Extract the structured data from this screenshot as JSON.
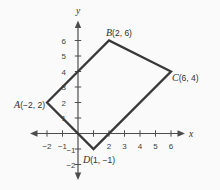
{
  "figure": {
    "type": "coordinate-plane-quadrilateral",
    "x_axis_label": "x",
    "y_axis_label": "y",
    "x_ticks": [
      {
        "value": -2,
        "label": "−2"
      },
      {
        "value": -1,
        "label": "−1"
      },
      {
        "value": 1,
        "label": ""
      },
      {
        "value": 2,
        "label": "2"
      },
      {
        "value": 3,
        "label": "3"
      },
      {
        "value": 4,
        "label": "4"
      },
      {
        "value": 5,
        "label": "5"
      },
      {
        "value": 6,
        "label": "6"
      }
    ],
    "y_ticks": [
      {
        "value": 6,
        "label": "6"
      },
      {
        "value": 5,
        "label": "5"
      },
      {
        "value": 4,
        "label": "4"
      },
      {
        "value": 3,
        "label": "3"
      },
      {
        "value": 2,
        "label": "2"
      },
      {
        "value": 1,
        "label": "1"
      },
      {
        "value": -1,
        "label": "−1"
      },
      {
        "value": -2,
        "label": "−2"
      }
    ],
    "vertices": [
      {
        "name": "A",
        "x": -2,
        "y": 2,
        "letter": "A",
        "coords": "(−2, 2)"
      },
      {
        "name": "B",
        "x": 2,
        "y": 6,
        "letter": "B",
        "coords": "(2, 6)"
      },
      {
        "name": "C",
        "x": 6,
        "y": 4,
        "letter": "C",
        "coords": "(6, 4)"
      },
      {
        "name": "D",
        "x": 1,
        "y": -1,
        "letter": "D",
        "coords": "(1, −1)"
      }
    ],
    "colors": {
      "axis": "#4d4d4d",
      "polygon": "#383838",
      "text": "#2f2f2f",
      "background": "#fafafa"
    }
  }
}
